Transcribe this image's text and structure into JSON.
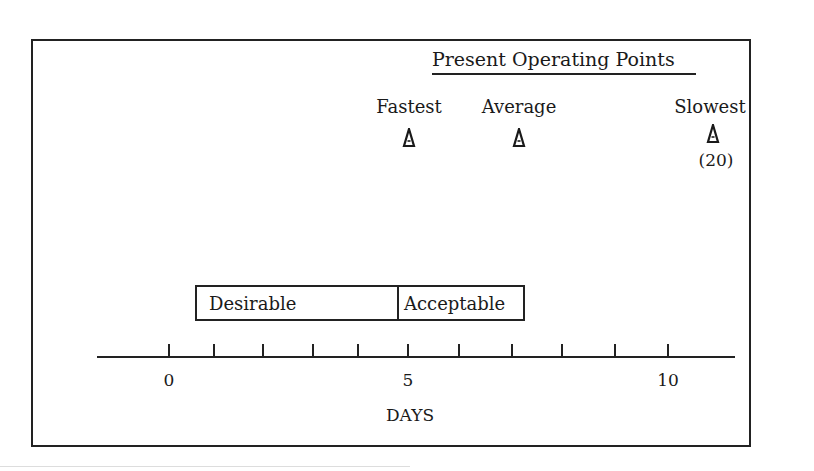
{
  "diagram": {
    "title": "Present Operating Points",
    "operating_points": [
      {
        "label": "Fastest",
        "x_px": 409,
        "approx_days": 5,
        "note": ""
      },
      {
        "label": "Average",
        "x_px": 519,
        "approx_days": 7.2,
        "note": ""
      },
      {
        "label": "Slowest",
        "x_px": 713,
        "approx_days": 20,
        "note": "(20)"
      }
    ],
    "ranges": [
      {
        "label": "Desirable",
        "from_days": 0.5,
        "to_days": 4.8
      },
      {
        "label": "Acceptable",
        "from_days": 4.8,
        "to_days": 7.3
      }
    ],
    "axis": {
      "title": "DAYS",
      "tick_labels": [
        {
          "text": "0",
          "x_px": 169
        },
        {
          "text": "5",
          "x_px": 408
        },
        {
          "text": "10",
          "x_px": 668
        }
      ],
      "tick_positions_px": [
        169,
        214,
        263,
        313,
        358,
        408,
        459,
        512,
        562,
        615,
        668
      ],
      "min": 0,
      "max": 10
    },
    "marker_icon": "triangle-marker-icon"
  }
}
